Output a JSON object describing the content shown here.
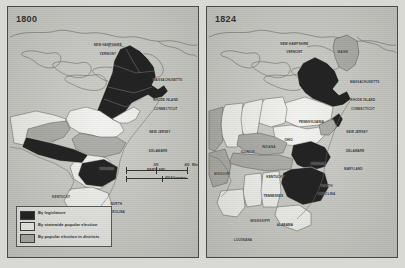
{
  "figure": {
    "type": "thematic-map-pair"
  },
  "legend": {
    "items": [
      {
        "swatch": "black",
        "color": "#0b0b0b",
        "label": "By legislature"
      },
      {
        "swatch": "white",
        "color": "#f4f4f1",
        "label": "By statewide popular election"
      },
      {
        "swatch": "gray",
        "color": "#a9a9a4",
        "label": "By popular election in districts"
      }
    ]
  },
  "scale": {
    "ticks": [
      "0",
      "200",
      "400"
    ],
    "unit_miles": "Miles",
    "unit_km": "400 Kilometers"
  },
  "panels": [
    {
      "id": "map-1800",
      "year": "1800",
      "labels": [
        {
          "text": "NEW HAMPSHIRE",
          "x": 52.5,
          "y": 15.5,
          "tone": "dark"
        },
        {
          "text": "VERMONT",
          "x": 52.5,
          "y": 19.0,
          "tone": "dark"
        },
        {
          "text": "MASSACHUSETTS",
          "x": 84.0,
          "y": 29.5,
          "tone": "dark"
        },
        {
          "text": "RHODE ISLAND",
          "x": 83.0,
          "y": 37.5,
          "tone": "dark"
        },
        {
          "text": "CONNECTICUT",
          "x": 83.0,
          "y": 41.0,
          "tone": "dark"
        },
        {
          "text": "NEW JERSEY",
          "x": 80.0,
          "y": 50.5,
          "tone": "dark"
        },
        {
          "text": "DELAWARE",
          "x": 79.0,
          "y": 58.0,
          "tone": "dark"
        },
        {
          "text": "MARYLAND",
          "x": 78.0,
          "y": 65.5,
          "tone": "dark"
        },
        {
          "text": "VIRGINIA",
          "x": 52.0,
          "y": 65.0,
          "tone": "dark"
        },
        {
          "text": "KENTUCKY",
          "x": 28.0,
          "y": 76.5,
          "tone": "dark"
        },
        {
          "text": "NORTH",
          "x": 57.0,
          "y": 79.0,
          "tone": "dark"
        },
        {
          "text": "CAROLINA",
          "x": 57.0,
          "y": 82.2,
          "tone": "dark"
        }
      ]
    },
    {
      "id": "map-1824",
      "year": "1824",
      "labels": [
        {
          "text": "NEW HAMPSHIRE",
          "x": 46.0,
          "y": 15.0,
          "tone": "dark"
        },
        {
          "text": "VERMONT",
          "x": 46.0,
          "y": 18.4,
          "tone": "dark"
        },
        {
          "text": "MAINE",
          "x": 71.5,
          "y": 18.5,
          "tone": "dark"
        },
        {
          "text": "MASSACHUSETTS",
          "x": 83.0,
          "y": 30.5,
          "tone": "dark"
        },
        {
          "text": "RHODE ISLAND",
          "x": 82.0,
          "y": 37.5,
          "tone": "dark"
        },
        {
          "text": "CONNECTICUT",
          "x": 82.0,
          "y": 41.0,
          "tone": "dark"
        },
        {
          "text": "PENNSYLVANIA",
          "x": 55.0,
          "y": 46.5,
          "tone": "dark"
        },
        {
          "text": "NEW JERSEY",
          "x": 79.0,
          "y": 50.5,
          "tone": "dark"
        },
        {
          "text": "DELAWARE",
          "x": 78.0,
          "y": 58.0,
          "tone": "dark"
        },
        {
          "text": "MARYLAND",
          "x": 77.0,
          "y": 65.0,
          "tone": "dark"
        },
        {
          "text": "OHIO",
          "x": 43.0,
          "y": 53.5,
          "tone": "dark"
        },
        {
          "text": "INDIANA",
          "x": 32.5,
          "y": 56.5,
          "tone": "dark"
        },
        {
          "text": "ILLINOIS",
          "x": 21.5,
          "y": 58.5,
          "tone": "dark"
        },
        {
          "text": "MISSOURI",
          "x": 8.0,
          "y": 67.0,
          "tone": "dark"
        },
        {
          "text": "VIRGINIA",
          "x": 58.5,
          "y": 63.0,
          "tone": "dark"
        },
        {
          "text": "KENTUCKY",
          "x": 36.0,
          "y": 68.5,
          "tone": "dark"
        },
        {
          "text": "TENNESSEE",
          "x": 35.0,
          "y": 76.0,
          "tone": "dark"
        },
        {
          "text": "NORTH",
          "x": 63.0,
          "y": 72.0,
          "tone": "dark"
        },
        {
          "text": "CAROLINA",
          "x": 63.0,
          "y": 75.2,
          "tone": "dark"
        },
        {
          "text": "MISSISSIPPI",
          "x": 28.0,
          "y": 86.0,
          "tone": "dark"
        },
        {
          "text": "ALABAMA",
          "x": 41.0,
          "y": 87.5,
          "tone": "dark"
        },
        {
          "text": "LOUISIANA",
          "x": 19.0,
          "y": 93.5,
          "tone": "dark"
        }
      ]
    }
  ]
}
